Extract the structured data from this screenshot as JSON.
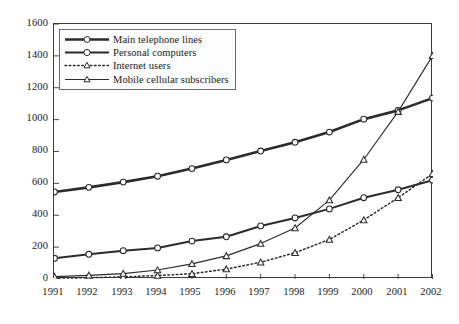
{
  "chart_data": {
    "type": "line",
    "title": "",
    "subtitle": "",
    "xlabel": "",
    "ylabel": "",
    "categories": [
      "1991",
      "1992",
      "1993",
      "1994",
      "1995",
      "1996",
      "1997",
      "1998",
      "1999",
      "2000",
      "2001",
      "2002"
    ],
    "x": [
      1991,
      1992,
      1993,
      1994,
      1995,
      1996,
      1997,
      1998,
      1999,
      2000,
      2001,
      2002
    ],
    "xlim": [
      1991,
      2002
    ],
    "ylim": [
      0,
      1600
    ],
    "yticks": [
      0,
      200,
      400,
      600,
      800,
      1000,
      1200,
      1400,
      1600
    ],
    "grid": false,
    "legend_position": "top-left",
    "series": [
      {
        "name": "Main telephone lines",
        "marker": "circle-open",
        "linestyle": "solid-thick",
        "color": "#2b2b2b",
        "values": [
          546,
          575,
          608,
          645,
          693,
          747,
          803,
          858,
          922,
          1003,
          1058,
          1135
        ]
      },
      {
        "name": "Personal computers",
        "marker": "circle-open",
        "linestyle": "solid-medium",
        "color": "#2b2b2b",
        "values": [
          130,
          155,
          178,
          195,
          238,
          265,
          333,
          383,
          440,
          510,
          560,
          620
        ]
      },
      {
        "name": "Internet users",
        "marker": "triangle-open",
        "linestyle": "dotted",
        "color": "#2b2b2b",
        "values": [
          5,
          8,
          13,
          22,
          33,
          62,
          105,
          165,
          248,
          370,
          510,
          660
        ]
      },
      {
        "name": "Mobile cellular subscribers",
        "marker": "triangle-open",
        "linestyle": "solid-thin",
        "color": "#2b2b2b",
        "values": [
          15,
          23,
          34,
          56,
          95,
          145,
          222,
          320,
          495,
          750,
          1050,
          1400
        ]
      }
    ]
  },
  "axes": {
    "y_tick_labels": [
      "1600",
      "1400",
      "1200",
      "1000",
      "800",
      "600",
      "400",
      "200",
      "0"
    ],
    "x_tick_labels": [
      "1991",
      "1992",
      "1993",
      "1994",
      "1995",
      "1996",
      "1997",
      "1998",
      "1999",
      "2000",
      "2001",
      "2002"
    ]
  },
  "legend": {
    "items": [
      {
        "label": "Main telephone lines",
        "key": "line-circle-thick"
      },
      {
        "label": "Personal computers",
        "key": "line-circle-medium"
      },
      {
        "label": "Internet users",
        "key": "line-triangle-dotted"
      },
      {
        "label": "Mobile cellular subscribers",
        "key": "line-triangle-thin"
      }
    ]
  }
}
